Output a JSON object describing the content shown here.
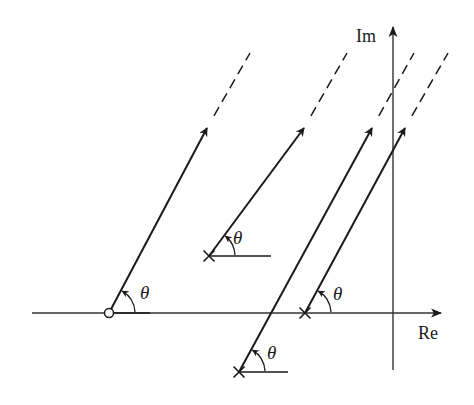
{
  "diagram": {
    "type": "root-locus-asymptotes",
    "colors": {
      "ink": "#1a1a1a",
      "axis": "#333333",
      "background": "#ffffff"
    },
    "axes": {
      "real_label": "Re",
      "imag_label": "Im",
      "real_axis": {
        "x1": 32,
        "x2": 441,
        "y": 313
      },
      "imag_axis": {
        "x": 393,
        "y1": 27,
        "y2": 370
      }
    },
    "angle_label": "θ",
    "rays": [
      {
        "id": "ray-zero",
        "origin_marker": "zero",
        "origin": [
          109,
          313
        ],
        "arrow_tip": [
          207,
          128
        ],
        "dash_end": [
          250,
          53
        ],
        "ref_end": [
          150,
          313
        ],
        "label_pos": [
          140,
          283
        ]
      },
      {
        "id": "ray-pole-upper",
        "origin_marker": "pole",
        "origin": [
          209,
          256
        ],
        "arrow_tip": [
          304,
          128
        ],
        "dash_end": [
          347,
          53
        ],
        "ref_end": [
          271,
          256
        ],
        "label_pos": [
          233,
          228
        ]
      },
      {
        "id": "ray-pole-lower",
        "origin_marker": "pole",
        "origin": [
          239,
          372
        ],
        "arrow_tip": [
          372,
          128
        ],
        "dash_end": [
          414,
          53
        ],
        "ref_end": [
          288,
          372
        ],
        "label_pos": [
          267,
          343
        ]
      },
      {
        "id": "ray-pole-axis",
        "origin_marker": "pole",
        "origin": [
          305,
          313
        ],
        "arrow_tip": [
          405,
          128
        ],
        "dash_end": [
          448,
          53
        ],
        "ref_end": null,
        "label_pos": [
          333,
          284
        ]
      }
    ]
  }
}
